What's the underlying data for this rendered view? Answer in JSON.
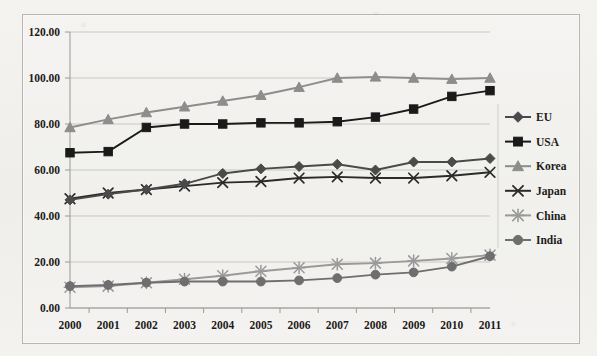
{
  "chart_data": {
    "type": "line",
    "title": "",
    "subtitle": "",
    "xlabel": "",
    "ylabel": "",
    "categories": [
      "2000",
      "2001",
      "2002",
      "2003",
      "2004",
      "2005",
      "2006",
      "2007",
      "2008",
      "2009",
      "2010",
      "2011"
    ],
    "x": [
      2000,
      2001,
      2002,
      2003,
      2004,
      2005,
      2006,
      2007,
      2008,
      2009,
      2010,
      2011
    ],
    "ylim": [
      0,
      120
    ],
    "ytick_values": [
      0,
      20,
      40,
      60,
      80,
      100,
      120
    ],
    "ytick_labels": [
      "0.00",
      "20.00",
      "40.00",
      "60.00",
      "80.00",
      "100.00",
      "120.00"
    ],
    "grid": true,
    "grid_axis": "y",
    "legend_position": "right",
    "series": [
      {
        "name": "EU",
        "marker": "diamond",
        "color": "#4a4a4a",
        "values": [
          47.0,
          49.5,
          51.5,
          54.0,
          58.5,
          60.5,
          61.5,
          62.5,
          60.0,
          63.5,
          63.5,
          65.0
        ]
      },
      {
        "name": "USA",
        "marker": "square",
        "color": "#1a1a1a",
        "values": [
          67.5,
          68.0,
          78.5,
          80.0,
          80.0,
          80.5,
          80.5,
          81.0,
          83.0,
          86.5,
          92.0,
          94.5
        ]
      },
      {
        "name": "Korea",
        "marker": "triangle",
        "color": "#8d8d8d",
        "values": [
          78.5,
          82.0,
          85.0,
          87.5,
          90.0,
          92.5,
          96.0,
          100.0,
          100.5,
          100.0,
          99.5,
          100.0
        ]
      },
      {
        "name": "Japan",
        "marker": "cross",
        "color": "#2b2b2b",
        "values": [
          47.5,
          50.0,
          51.5,
          53.0,
          54.5,
          55.0,
          56.5,
          57.0,
          56.5,
          56.5,
          57.5,
          59.0
        ]
      },
      {
        "name": "China",
        "marker": "star",
        "color": "#9a9a9a",
        "values": [
          9.0,
          9.5,
          11.0,
          12.5,
          14.0,
          16.0,
          17.5,
          19.0,
          19.5,
          20.5,
          21.5,
          23.0
        ]
      },
      {
        "name": "India",
        "marker": "circle",
        "color": "#6e6e6e",
        "values": [
          9.5,
          10.0,
          11.0,
          11.5,
          11.5,
          11.5,
          12.0,
          13.0,
          14.5,
          15.5,
          18.0,
          22.5
        ]
      }
    ]
  },
  "legend": {
    "items": [
      {
        "label": "EU"
      },
      {
        "label": "USA"
      },
      {
        "label": "Korea"
      },
      {
        "label": "Japan"
      },
      {
        "label": "China"
      },
      {
        "label": "India"
      }
    ]
  },
  "colors": {
    "plot_background": "#f4f3f0",
    "grid_line": "#c9c7c2",
    "axis_line": "#9a9892",
    "frame_border": "#b9b6b0",
    "text": "#1d1b18"
  }
}
